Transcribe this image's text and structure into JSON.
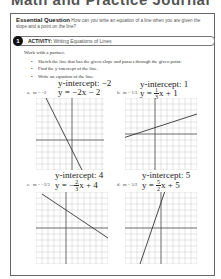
{
  "header": {
    "title": "Math and Practice Journal"
  },
  "essential_question": {
    "label": "Essential Question",
    "text": "How can you write an equation of a line when you are given the slope and a point on the line?"
  },
  "activity": {
    "number": "1",
    "label": "ACTIVITY:",
    "title": "Writing Equations of Lines"
  },
  "intro": "Work with a partner.",
  "instructions": [
    "Sketch the line that has the given slope and passes through the given point.",
    "Find the y-intercept of the line.",
    "Write an equation of the line."
  ],
  "problems": [
    {
      "letter": "a.",
      "slope": "m = −2",
      "intercept": "y-intercept: −2",
      "equation": "y = −2x − 2",
      "eq_prefix": "y = −2x − 2",
      "frac": null,
      "eq_suffix": ""
    },
    {
      "letter": "b.",
      "slope": "m = 1/3",
      "intercept": "y-intercept: 1",
      "eq_prefix": "y = ",
      "frac": {
        "num": "1",
        "den": "3"
      },
      "eq_suffix": "x + 1"
    },
    {
      "letter": "c.",
      "slope": "m = −2/3",
      "intercept": "y-intercept: 4",
      "eq_prefix": "y = −",
      "frac": {
        "num": "2",
        "den": "3"
      },
      "eq_suffix": "x + 4"
    },
    {
      "letter": "d.",
      "slope": "m = 5/2",
      "intercept": "y-intercept: 5",
      "eq_prefix": "y = ",
      "frac": {
        "num": "5",
        "den": "2"
      },
      "eq_suffix": "x + 5"
    }
  ]
}
